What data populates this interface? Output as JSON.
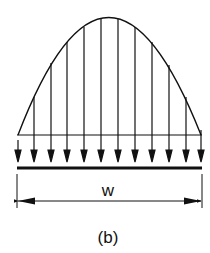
{
  "figure": {
    "label": "(b)",
    "dimension_label": "w",
    "load_arrow_count": 12,
    "colors": {
      "stroke": "#111111",
      "background": "#ffffff"
    }
  }
}
